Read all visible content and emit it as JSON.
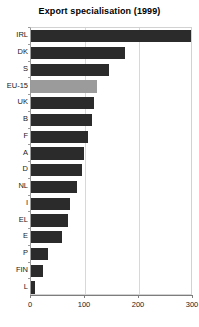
{
  "chart_data": {
    "type": "bar",
    "orientation": "horizontal",
    "title": "Export specialisation (1999)",
    "xlabel": "",
    "ylabel": "",
    "categories": [
      "IRL",
      "DK",
      "S",
      "EU-15",
      "UK",
      "B",
      "F",
      "A",
      "D",
      "NL",
      "I",
      "EL",
      "E",
      "P",
      "FIN",
      "L"
    ],
    "values": [
      296,
      174,
      144,
      122,
      117,
      113,
      105,
      98,
      94,
      85,
      72,
      68,
      57,
      31,
      22,
      7
    ],
    "xlim": [
      0,
      300
    ],
    "xticks": [
      0,
      100,
      200,
      300
    ],
    "xtick_labels": [
      "0",
      "100",
      "200",
      "300"
    ],
    "grid": "vertical",
    "legend": "none",
    "highlighted_category": "EU-15",
    "colors": {
      "bar": "#2b2b2b",
      "bar_highlight": "#9b9b9b",
      "gridline": "#d8d8d8",
      "axis": "#7d7d7d",
      "plot_border": "#d2d2d2",
      "text": "#1a1a1a",
      "background": "#ffffff"
    }
  }
}
